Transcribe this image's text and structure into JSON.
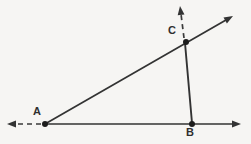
{
  "figure": {
    "type": "geometry-diagram",
    "width": 251,
    "height": 144,
    "background_color": "#f6f5f3",
    "stroke_color": "#333333",
    "dash_color": "#3a3a3a",
    "point_color": "#1c1c1c",
    "label_color": "#2f2f2f"
  },
  "points": [
    {
      "id": "A",
      "label": "A",
      "x": 45,
      "y": 124,
      "label_x": 33,
      "label_y": 106,
      "dot_radius": 3.0
    },
    {
      "id": "B",
      "label": "B",
      "x": 192,
      "y": 124,
      "label_x": 186,
      "label_y": 127,
      "dot_radius": 3.0
    },
    {
      "id": "C",
      "label": "C",
      "x": 186,
      "y": 42,
      "label_x": 168,
      "label_y": 25,
      "dot_radius": 3.0
    }
  ],
  "segments": [
    {
      "id": "ray-ab",
      "name": "ray-from-a-through-b",
      "style": "solid",
      "x1": 45,
      "y1": 124,
      "x2": 234,
      "y2": 124,
      "width": 1.7,
      "arrow_end": true,
      "arrow_start": false
    },
    {
      "id": "dash-left-of-a",
      "name": "dashed-extension-left-of-a",
      "style": "dashed",
      "x1": 41,
      "y1": 124,
      "x2": 16,
      "y2": 124,
      "width": 1.7,
      "arrow_end": false,
      "arrow_start": true,
      "dash_pattern": "5,4"
    },
    {
      "id": "ray-ac",
      "name": "ray-from-a-through-c",
      "style": "solid",
      "x1": 45,
      "y1": 124,
      "x2": 226,
      "y2": 20,
      "width": 1.7,
      "arrow_end": true,
      "arrow_start": false
    },
    {
      "id": "segment-cb",
      "name": "segment-c-to-b",
      "style": "solid",
      "x1": 185,
      "y1": 43,
      "x2": 192,
      "y2": 123,
      "width": 1.9,
      "arrow_end": false,
      "arrow_start": false
    },
    {
      "id": "dash-above-c",
      "name": "dashed-extension-above-c",
      "style": "dashed",
      "x1": 184,
      "y1": 38,
      "x2": 181,
      "y2": 14,
      "width": 1.7,
      "arrow_end": true,
      "arrow_start": false,
      "dash_pattern": "5,4"
    }
  ],
  "arrowheads": [
    {
      "id": "arrow-ab-right",
      "name": "arrowhead-right-horizontal",
      "tip_x": 241,
      "tip_y": 124,
      "angle_deg": 0
    },
    {
      "id": "arrow-left-dash",
      "name": "arrowhead-left-dashed",
      "tip_x": 7,
      "tip_y": 124,
      "angle_deg": 180
    },
    {
      "id": "arrow-ac-upper",
      "name": "arrowhead-upper-right-diagonal",
      "tip_x": 233,
      "tip_y": 16,
      "angle_deg": -30
    },
    {
      "id": "arrow-c-up",
      "name": "arrowhead-up-dashed",
      "tip_x": 180,
      "tip_y": 6,
      "angle_deg": -97
    }
  ]
}
